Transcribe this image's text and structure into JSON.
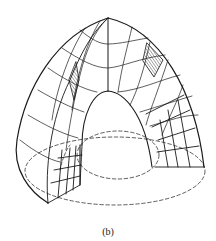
{
  "figure": {
    "caption": "(b)",
    "colors": {
      "stroke": "#1a1a1a",
      "background": "#ffffff"
    },
    "elements": {
      "outer_surface": "outer-dome-surface",
      "inner_surface": "inner-cavity-surface",
      "mesh": "curvilinear-grid",
      "hatched_cells": 2,
      "base_ellipses": 2
    }
  }
}
